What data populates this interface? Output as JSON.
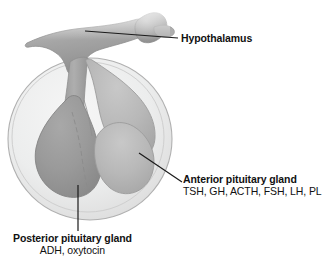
{
  "figure": {
    "type": "anatomical-diagram",
    "background_color": "#ffffff"
  },
  "labels": {
    "hypothalamus": {
      "title": "Hypothalamus",
      "hormones": ""
    },
    "anterior": {
      "title": "Anterior pituitary gland",
      "hormones": "TSH, GH, ACTH, FSH, LH, PL"
    },
    "posterior": {
      "title": "Posterior pituitary gland",
      "hormones": "ADH, oxytocin"
    }
  },
  "structures": {
    "sella_turcica": {
      "name": "sella turcica",
      "fill": "#eeeeee",
      "rim": "#b6b6b6"
    },
    "hypothalamus_body": {
      "name": "hypothalamus",
      "fill": "#a7a7a7"
    },
    "mammillary_body": {
      "name": "mammillary body knob",
      "fill": "#9e9e9e"
    },
    "infundibulum": {
      "name": "infundibulum stalk",
      "fill": "#a0a0a0"
    },
    "posterior_lobe": {
      "name": "posterior pituitary lobe",
      "fill": "#9a9a9a"
    },
    "anterior_lobe": {
      "name": "anterior pituitary lobe",
      "fill": "#b8b8b8"
    },
    "leader_line_color": "#1a1a1a"
  }
}
